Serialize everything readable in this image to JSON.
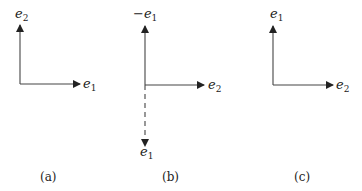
{
  "panels": [
    {
      "id": "a",
      "caption": "(a)",
      "vertical": {
        "base": "e",
        "sub": "2",
        "prefix": ""
      },
      "horizontal": {
        "base": "e",
        "sub": "1",
        "prefix": ""
      }
    },
    {
      "id": "b",
      "caption": "(b)",
      "vertical": {
        "base": "e",
        "sub": "1",
        "prefix": "−"
      },
      "horizontal": {
        "base": "e",
        "sub": "2",
        "prefix": ""
      },
      "dashed_down": {
        "base": "e",
        "sub": "1",
        "prefix": ""
      }
    },
    {
      "id": "c",
      "caption": "(c)",
      "vertical": {
        "base": "e",
        "sub": "1",
        "prefix": ""
      },
      "horizontal": {
        "base": "e",
        "sub": "2",
        "prefix": ""
      }
    }
  ],
  "colors": {
    "line": "#333333",
    "text": "#222222"
  }
}
